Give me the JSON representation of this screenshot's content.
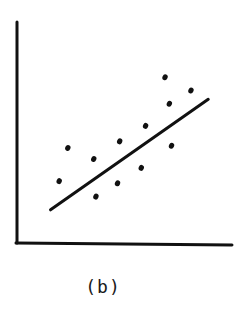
{
  "chart_data": {
    "type": "scatter",
    "title": "",
    "caption": "(b)",
    "xlabel": "",
    "ylabel": "",
    "xlim": [
      0,
      10
    ],
    "ylim": [
      0,
      10
    ],
    "grid": false,
    "legend": null,
    "ticks": false,
    "series": [
      {
        "name": "observations",
        "marker": "dot",
        "points": [
          {
            "x": 2.4,
            "y": 4.3
          },
          {
            "x": 3.6,
            "y": 3.8
          },
          {
            "x": 2.0,
            "y": 2.8
          },
          {
            "x": 4.8,
            "y": 4.6
          },
          {
            "x": 6.0,
            "y": 5.3
          },
          {
            "x": 6.9,
            "y": 7.5
          },
          {
            "x": 8.1,
            "y": 6.9
          },
          {
            "x": 7.1,
            "y": 6.3
          },
          {
            "x": 7.2,
            "y": 4.4
          },
          {
            "x": 5.8,
            "y": 3.4
          },
          {
            "x": 4.7,
            "y": 2.7
          },
          {
            "x": 3.7,
            "y": 2.1
          }
        ]
      },
      {
        "name": "fitted-line",
        "type": "line",
        "points": [
          {
            "x": 1.6,
            "y": 1.5
          },
          {
            "x": 8.9,
            "y": 6.5
          }
        ]
      }
    ]
  },
  "colors": {
    "ink": "#111111",
    "background": "#ffffff"
  }
}
